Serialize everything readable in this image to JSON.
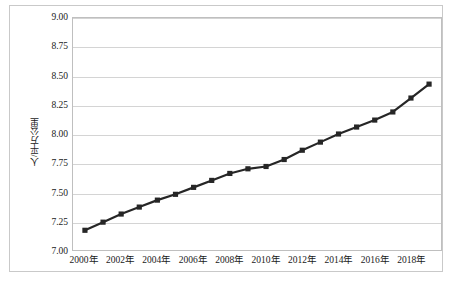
{
  "chart_data": {
    "type": "line",
    "title": "",
    "subtitle": "",
    "xlabel": "",
    "ylabel": "人/平方公里",
    "x": [
      2000,
      2001,
      2002,
      2003,
      2004,
      2005,
      2006,
      2007,
      2008,
      2009,
      2010,
      2011,
      2012,
      2013,
      2014,
      2015,
      2016,
      2017,
      2018,
      2019
    ],
    "values": [
      7.17,
      7.24,
      7.31,
      7.37,
      7.43,
      7.48,
      7.54,
      7.6,
      7.66,
      7.7,
      7.72,
      7.78,
      7.86,
      7.93,
      8.0,
      8.06,
      8.12,
      8.19,
      8.31,
      8.43
    ],
    "series": [
      {
        "name": "人口密度",
        "values": [
          7.17,
          7.24,
          7.31,
          7.37,
          7.43,
          7.48,
          7.54,
          7.6,
          7.66,
          7.7,
          7.72,
          7.78,
          7.86,
          7.93,
          8.0,
          8.06,
          8.12,
          8.19,
          8.31,
          8.43
        ],
        "marker": "square",
        "color": "#262626"
      }
    ],
    "ylim": [
      7.0,
      9.0
    ],
    "ytick_values": [
      7.0,
      7.25,
      7.5,
      7.75,
      8.0,
      8.25,
      8.5,
      8.75,
      9.0
    ],
    "ytick_labels": [
      "7.00",
      "7.25",
      "7.50",
      "7.75",
      "8.00",
      "8.25",
      "8.50",
      "8.75",
      "9.00"
    ],
    "xtick_values": [
      2000,
      2002,
      2004,
      2006,
      2008,
      2010,
      2012,
      2014,
      2016,
      2018
    ],
    "xtick_labels": [
      "2000年",
      "2002年",
      "2004年",
      "2006年",
      "2008年",
      "2010年",
      "2012年",
      "2014年",
      "2016年",
      "2018年"
    ],
    "xlim": [
      2000,
      2019
    ],
    "grid": "horizontal",
    "legend": "none",
    "colors": {
      "line": "#262626",
      "marker": "#262626",
      "gridline": "#d4d4d4",
      "frame": "#bfbfbf",
      "outer_border": "#c9c9c9",
      "text": "#1a1a1a",
      "background": "#ffffff"
    }
  }
}
